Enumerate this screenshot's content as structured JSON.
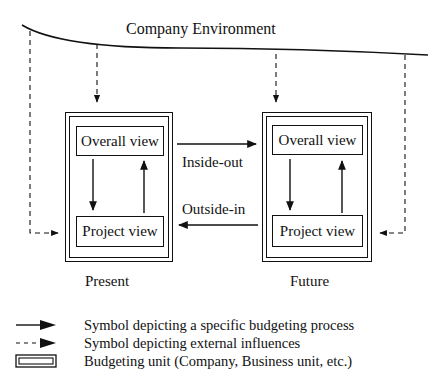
{
  "diagram": {
    "environment_label": "Company Environment",
    "units": [
      {
        "name": "Present",
        "top_box": "Overall view",
        "bottom_box": "Project view"
      },
      {
        "name": "Future",
        "top_box": "Overall view",
        "bottom_box": "Project view"
      }
    ],
    "connections": {
      "inside_out": "Inside-out",
      "outside_in": "Outside-in"
    }
  },
  "legend": {
    "items": [
      {
        "symbol": "solid-arrow",
        "text": "Symbol depicting a specific budgeting process"
      },
      {
        "symbol": "dashed-arrow",
        "text": "Symbol depicting external influences"
      },
      {
        "symbol": "double-box",
        "text": "Budgeting unit (Company, Business unit, etc.)"
      }
    ]
  },
  "colors": {
    "line": "#111111",
    "background": "#ffffff"
  }
}
